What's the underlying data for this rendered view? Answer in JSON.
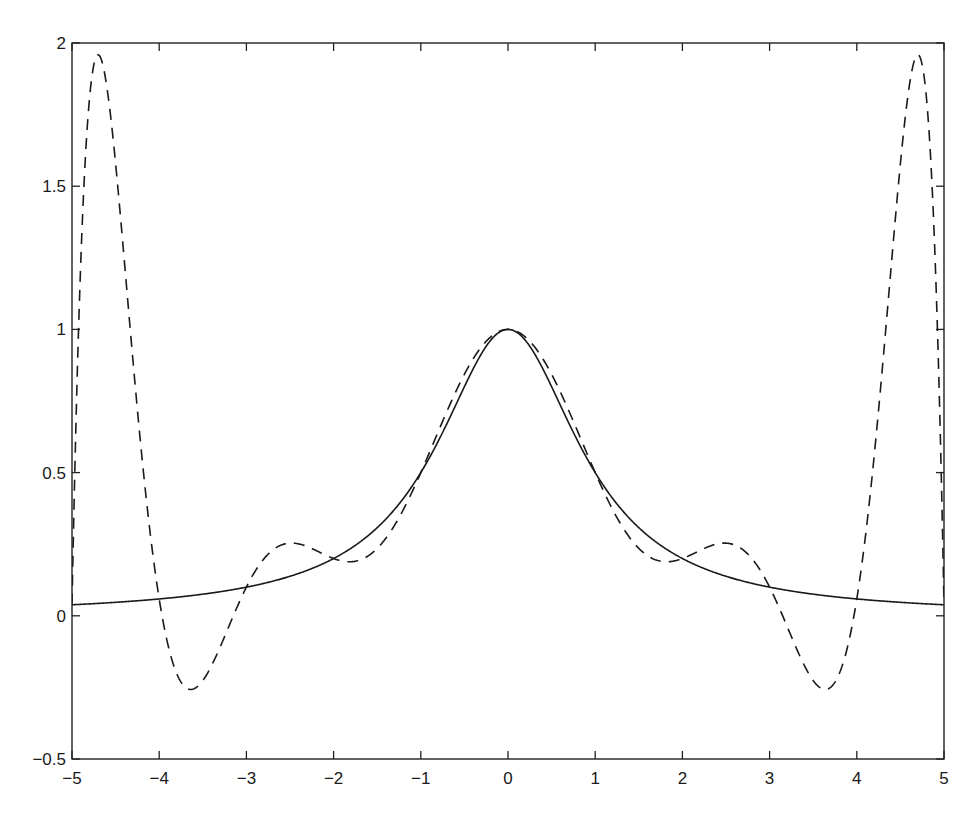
{
  "chart_data": {
    "type": "line",
    "title": "",
    "xlabel": "",
    "ylabel": "",
    "xlim": [
      -5,
      5
    ],
    "ylim": [
      -0.5,
      2
    ],
    "grid": false,
    "legend": null,
    "x_ticks": [
      -5,
      -4,
      -3,
      -2,
      -1,
      0,
      1,
      2,
      3,
      4,
      5
    ],
    "x_tick_labels": [
      "-5",
      "-4",
      "-3",
      "-2",
      "-1",
      "0",
      "1",
      "2",
      "3",
      "4",
      "5"
    ],
    "y_ticks": [
      -0.5,
      0,
      0.5,
      1,
      1.5,
      2
    ],
    "y_tick_labels": [
      "-0.5",
      "0",
      "0.5",
      "1",
      "1.5",
      "2"
    ],
    "series": [
      {
        "name": "f(x) = 1/(1+x^2)",
        "style": "solid",
        "color": "#1a1a1a",
        "x": [
          -5,
          -4,
          -3,
          -2,
          -1,
          0,
          1,
          2,
          3,
          4,
          5
        ],
        "values": [
          0.038,
          0.059,
          0.1,
          0.2,
          0.5,
          1.0,
          0.5,
          0.2,
          0.1,
          0.059,
          0.038
        ]
      },
      {
        "name": "Degree-10 interpolating polynomial (11 equispaced nodes)",
        "style": "dashed",
        "color": "#1a1a1a",
        "nodes_x": [
          -5,
          -4,
          -3,
          -2,
          -1,
          0,
          1,
          2,
          3,
          4,
          5
        ],
        "key_points": [
          {
            "x": -4.8,
            "y": 1.92
          },
          {
            "x": -3.65,
            "y": -0.25
          },
          {
            "x": -2.5,
            "y": 0.25
          },
          {
            "x": -1.75,
            "y": 0.19
          },
          {
            "x": 0,
            "y": 1.0
          },
          {
            "x": 1.75,
            "y": 0.19
          },
          {
            "x": 2.5,
            "y": 0.25
          },
          {
            "x": 3.65,
            "y": -0.25
          },
          {
            "x": 4.8,
            "y": 1.92
          }
        ]
      }
    ]
  }
}
